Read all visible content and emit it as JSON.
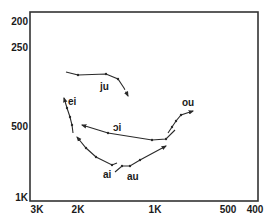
{
  "chart_data": {
    "type": "line",
    "title": "",
    "xlabel": "",
    "ylabel": "",
    "x_axis": {
      "scale": "log-reversed",
      "ticks": [
        {
          "label": "3K",
          "x": 37
        },
        {
          "label": "2K",
          "x": 78
        },
        {
          "label": "1K",
          "x": 155
        },
        {
          "label": "500",
          "x": 228
        },
        {
          "label": "400",
          "x": 255
        }
      ]
    },
    "y_axis": {
      "scale": "log-inverted",
      "ticks": [
        {
          "label": "200",
          "y": 21
        },
        {
          "label": "250",
          "y": 47
        },
        {
          "label": "500",
          "y": 126
        },
        {
          "label": "1K",
          "y": 197
        }
      ]
    },
    "grid": false,
    "legend": null,
    "frame": {
      "x": 30,
      "y": 12,
      "w": 228,
      "h": 189
    },
    "series": [
      {
        "name": "ju",
        "label_pos": [
          100,
          90
        ],
        "points": [
          [
            66,
            72
          ],
          [
            78,
            75
          ],
          [
            106,
            74
          ],
          [
            118,
            79
          ],
          [
            124,
            88
          ],
          [
            128,
            96
          ]
        ],
        "dashed_tail": true
      },
      {
        "name": "ei",
        "label_pos": [
          68,
          105
        ],
        "points": [
          [
            73,
            133
          ],
          [
            72,
            125
          ],
          [
            70,
            117
          ],
          [
            67,
            108
          ],
          [
            64,
            98
          ]
        ]
      },
      {
        "name": "ɔi",
        "label_pos": [
          113,
          131
        ],
        "points": [
          [
            175,
            130
          ],
          [
            166,
            139
          ],
          [
            152,
            140
          ],
          [
            108,
            133
          ],
          [
            82,
            125
          ]
        ]
      },
      {
        "name": "ai",
        "label_pos": [
          103,
          178
        ],
        "points": [
          [
            117,
            163
          ],
          [
            112,
            165
          ],
          [
            96,
            157
          ],
          [
            86,
            148
          ],
          [
            77,
            137
          ]
        ]
      },
      {
        "name": "au",
        "label_pos": [
          127,
          180
        ],
        "points": [
          [
            115,
            172
          ],
          [
            122,
            166
          ],
          [
            130,
            166
          ],
          [
            140,
            160
          ],
          [
            166,
            146
          ]
        ]
      },
      {
        "name": "ou",
        "label_pos": [
          182,
          106
        ],
        "points": [
          [
            168,
            133
          ],
          [
            172,
            127
          ],
          [
            176,
            121
          ],
          [
            181,
            115
          ],
          [
            193,
            111
          ]
        ]
      }
    ]
  }
}
